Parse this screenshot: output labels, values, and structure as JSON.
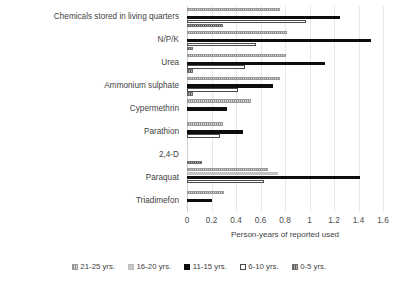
{
  "chart_data": {
    "type": "bar",
    "orientation": "horizontal",
    "title": "",
    "xlabel": "Person-years of reported used",
    "ylabel": "",
    "xlim": [
      0,
      1.6
    ],
    "xticks": [
      "0",
      "0.2",
      "0.4",
      "0.6",
      "0.8",
      "1",
      "1.2",
      "1.4",
      "1.6"
    ],
    "xtick_values": [
      0,
      0.2,
      0.4,
      0.6,
      0.8,
      1,
      1.2,
      1.4,
      1.6
    ],
    "grid": true,
    "legend_position": "bottom",
    "categories": [
      "Chemicals stored in living quarters",
      "N/P/K",
      "Urea",
      "Ammonium sulphate",
      "Cypermethrin",
      "Parathion",
      "2,4-D",
      "Paraquat",
      "Triadimefon"
    ],
    "series": [
      {
        "name": "21-25 yrs.",
        "color": "#b6b6b6",
        "pattern": "hatched-light",
        "values": [
          0.76,
          0.82,
          0.81,
          0.76,
          0.52,
          0.29,
          0.0,
          0.66,
          0.3
        ]
      },
      {
        "name": "16-20 yrs.",
        "color": "#c9c9c9",
        "pattern": "solid-light",
        "values": [
          0.0,
          0.0,
          0.0,
          0.0,
          0.0,
          0.0,
          0.0,
          0.74,
          0.0
        ]
      },
      {
        "name": "11-15 yrs.",
        "color": "#0d0d0d",
        "pattern": "solid-black",
        "values": [
          1.25,
          1.5,
          1.13,
          0.7,
          0.33,
          0.46,
          0.0,
          1.41,
          0.2
        ]
      },
      {
        "name": "6-10 yrs.",
        "color": "#ffffff",
        "pattern": "outline",
        "values": [
          0.97,
          0.56,
          0.47,
          0.42,
          0.0,
          0.27,
          0.0,
          0.63,
          0.0
        ]
      },
      {
        "name": "0-5 yrs.",
        "color": "#8c8c8c",
        "pattern": "hatched-dark",
        "values": [
          0.29,
          0.05,
          0.05,
          0.05,
          0.0,
          0.0,
          0.12,
          0.0,
          0.0
        ]
      }
    ]
  },
  "legend": {
    "items": [
      {
        "label": "21-25 yrs.",
        "series_index": 0
      },
      {
        "label": "16-20 yrs.",
        "series_index": 1
      },
      {
        "label": "11-15 yrs.",
        "series_index": 2
      },
      {
        "label": "6-10 yrs.",
        "series_index": 3
      },
      {
        "label": "0-5 yrs.",
        "series_index": 4
      }
    ]
  }
}
